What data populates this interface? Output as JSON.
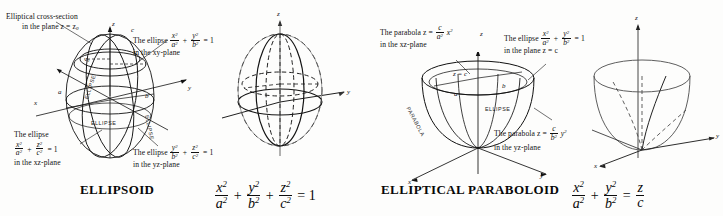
{
  "figure": {
    "background_color": "#fdfdfc",
    "ink_color": "#111111"
  },
  "panels": [
    {
      "id": "ellipsoid",
      "caption": "ELLIPSOID",
      "main_equation_parts": [
        "x",
        "a",
        "y",
        "b",
        "z",
        "c",
        "= 1"
      ],
      "annotations": [
        {
          "name": "elliptical-cross-section",
          "line1": "Elliptical cross-section",
          "line2": "in the plane z = z",
          "subscript": "0"
        },
        {
          "name": "ellipse-xy-plane",
          "prefix": "The ellipse",
          "num1": "x",
          "den1": "a",
          "num2": "y",
          "den2": "b",
          "rhs": "= 1",
          "line2": "in the xy-plane"
        },
        {
          "name": "ellipse-xz-plane",
          "prefix": "The ellipse",
          "num1": "x",
          "den1": "a",
          "num2": "z",
          "den2": "c",
          "rhs": "= 1",
          "line2": "in the xz-plane"
        },
        {
          "name": "ellipse-yz-plane",
          "prefix": "The ellipse",
          "num1": "y",
          "den1": "b",
          "num2": "z",
          "den2": "c",
          "rhs": "= 1",
          "line2": "in the yz-plane"
        }
      ],
      "figure_labels": {
        "axis_z": "z",
        "axis_y": "y",
        "axis_x": "x",
        "semi_axis_a": "a",
        "semi_axis_b": "b",
        "semi_axis_c": "c",
        "plane_height": "z",
        "plane_height_sub": "0",
        "curve_names": [
          "ELLIPSE",
          "ELLIPSE",
          "ELLIPSE"
        ]
      },
      "clean_figure_labels": {
        "axis_z": "z",
        "axis_y": "y",
        "axis_x": "x"
      }
    },
    {
      "id": "paraboloid",
      "caption": "ELLIPTICAL PARABOLOID",
      "main_equation_parts": [
        "x",
        "a",
        "y",
        "b",
        "z",
        "c"
      ],
      "annotations": [
        {
          "name": "parabola-xz-plane",
          "prefix": "The parabola z =",
          "num1": "c",
          "den1": "a",
          "tail": "x",
          "line2": "in the xz-plane"
        },
        {
          "name": "ellipse-plane-z-equals-c",
          "prefix": "The ellipse",
          "num1": "x",
          "den1": "a",
          "num2": "y",
          "den2": "b",
          "rhs": "= 1",
          "line2": "in the plane z = c"
        },
        {
          "name": "parabola-yz-plane",
          "prefix": "The parabola z =",
          "num1": "c",
          "den1": "b",
          "tail": "y",
          "line2": "in the yz-plane"
        }
      ],
      "figure_labels": {
        "axis_z": "z",
        "axis_y": "y",
        "axis_x": "x",
        "plane_label": "z = c",
        "semi_axis_a": "a",
        "semi_axis_b": "b",
        "curve_parabola": "PARABOLA",
        "curve_ellipse": "ELLIPSE"
      },
      "clean_figure_labels": {
        "axis_z": "z",
        "axis_y": "y",
        "axis_x": "x"
      }
    }
  ]
}
